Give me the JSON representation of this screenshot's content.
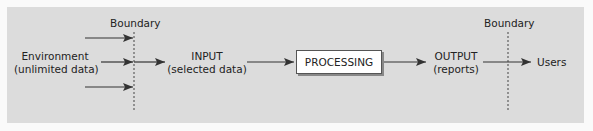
{
  "diagram": {
    "boundary_left_label": "Boundary",
    "boundary_right_label": "Boundary",
    "environment": {
      "line1": "Environment",
      "line2": "(unlimited data)"
    },
    "input": {
      "line1": "INPUT",
      "line2": "(selected data)"
    },
    "processing": "PROCESSING",
    "output": {
      "line1": "OUTPUT",
      "line2": "(reports)"
    },
    "users": "Users",
    "colors": {
      "panel": "#dcdcdc",
      "arrow": "#333333",
      "box": "#ffffff"
    }
  }
}
